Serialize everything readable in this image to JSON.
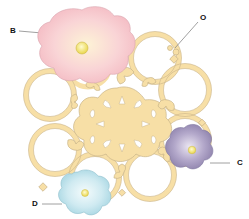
{
  "diagram": {
    "labels": [
      {
        "id": "B",
        "text": "B",
        "x": 10,
        "y": 28,
        "target": "large-pink-flower"
      },
      {
        "id": "O",
        "text": "O",
        "x": 200,
        "y": 14,
        "target": "filigree-doily"
      },
      {
        "id": "C",
        "text": "C",
        "x": 238,
        "y": 161,
        "target": "purple-flower"
      },
      {
        "id": "D",
        "text": "D",
        "x": 32,
        "y": 200,
        "target": "blue-flower"
      }
    ],
    "colors": {
      "filigree_fill": "#f7dfa6",
      "filigree_stroke": "#c9b48a",
      "pink_flower": "#f8c9cf",
      "pink_center": "#fbf3d0",
      "purple_flower": "#a79cc0",
      "purple_center": "#e8e3f0",
      "blue_flower": "#bfe3ec",
      "blue_center": "#eef8fa",
      "bead": "#f5e36a",
      "leader_line": "#888888"
    }
  }
}
